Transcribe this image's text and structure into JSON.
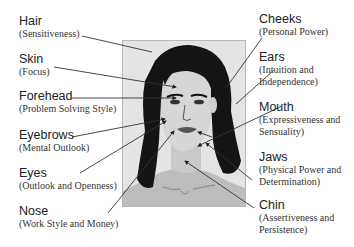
{
  "diagram": {
    "left_labels": [
      {
        "title": "Hair",
        "meaning": "(Sensitiveness)"
      },
      {
        "title": "Skin",
        "meaning": "(Focus)"
      },
      {
        "title": "Forehead",
        "meaning": "(Problem Solving Style)"
      },
      {
        "title": "Eyebrows",
        "meaning": "(Mental Outlook)"
      },
      {
        "title": "Eyes",
        "meaning": "(Outlook and Openness)"
      },
      {
        "title": "Nose",
        "meaning": "(Work Style and Money)"
      }
    ],
    "right_labels": [
      {
        "title": "Cheeks",
        "meaning": "(Personal Power)"
      },
      {
        "title": "Ears",
        "meaning1": "(Intuition and",
        "meaning2": "Independence)"
      },
      {
        "title": "Mouth",
        "meaning1": "(Expressiveness and",
        "meaning2": "Sensuality)"
      },
      {
        "title": "Jaws",
        "meaning1": "(Physical Power and",
        "meaning2": "Determination)"
      },
      {
        "title": "Chin",
        "meaning1": "(Assertiveness and",
        "meaning2": "Persistence)"
      }
    ],
    "colors": {
      "hair": "#111111",
      "skin": "#d4d4d4",
      "background": "#e2e2e2",
      "lips": "#555555",
      "leader_line": "#333333"
    }
  }
}
